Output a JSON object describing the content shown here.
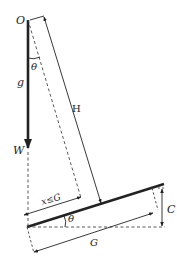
{
  "diagram": {
    "type": "physics-free-body",
    "colors": {
      "ink": "#222222",
      "background": "#ffffff"
    },
    "labels": {
      "origin": "O",
      "theta_top": "θ",
      "gravity": "g",
      "weight": "W",
      "height": "H",
      "x_constraint": "x≤G",
      "theta_bottom": "θ",
      "gap": "G",
      "rise": "C"
    }
  }
}
